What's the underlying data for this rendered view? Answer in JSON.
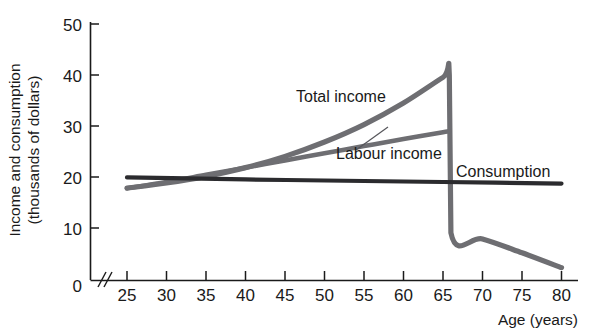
{
  "chart_data": {
    "type": "line",
    "title": "",
    "xlabel": "Age (years)",
    "ylabel": "Income and consumption (thousands of dollars)",
    "ylabel_line1": "Income and consumption",
    "ylabel_line2": "(thousands of dollars)",
    "xlim": [
      25,
      80
    ],
    "ylim": [
      0,
      50
    ],
    "x_ticks": [
      25,
      30,
      35,
      40,
      45,
      50,
      55,
      60,
      65,
      70,
      75,
      80
    ],
    "y_ticks": [
      0,
      10,
      20,
      30,
      40,
      50
    ],
    "x_axis_break": true,
    "grid": false,
    "legend": "inline-labels",
    "series": [
      {
        "name": "Total income",
        "color": "#6e6e72",
        "label_text": "Total income",
        "points": [
          [
            25,
            18.0
          ],
          [
            30,
            19.0
          ],
          [
            35,
            20.3
          ],
          [
            40,
            22.0
          ],
          [
            45,
            24.2
          ],
          [
            50,
            27.0
          ],
          [
            55,
            30.4
          ],
          [
            60,
            34.6
          ],
          [
            65,
            39.6
          ],
          [
            65.8,
            40.0
          ],
          [
            66.0,
            9.3
          ],
          [
            70,
            8.1
          ],
          [
            75,
            5.4
          ],
          [
            80,
            2.5
          ]
        ]
      },
      {
        "name": "Labour income",
        "color": "#6e6e72",
        "label_text": "Labour income",
        "points": [
          [
            25,
            18.0
          ],
          [
            30,
            19.2
          ],
          [
            35,
            20.6
          ],
          [
            40,
            22.0
          ],
          [
            45,
            23.4
          ],
          [
            50,
            24.8
          ],
          [
            55,
            26.2
          ],
          [
            60,
            27.6
          ],
          [
            65,
            28.9
          ],
          [
            65.8,
            29.1
          ]
        ]
      },
      {
        "name": "Consumption",
        "color": "#2b2b2e",
        "label_text": "Consumption",
        "points": [
          [
            25,
            20.1
          ],
          [
            40,
            19.7
          ],
          [
            55,
            19.4
          ],
          [
            65,
            19.2
          ],
          [
            80,
            18.9
          ]
        ]
      }
    ],
    "annotations": [
      {
        "text": "Total income",
        "x_px": 296,
        "y_px": 102
      },
      {
        "text": "Labour income",
        "x_px": 336,
        "y_px": 159
      },
      {
        "text": "Consumption",
        "x_px": 456,
        "y_px": 177
      }
    ]
  }
}
